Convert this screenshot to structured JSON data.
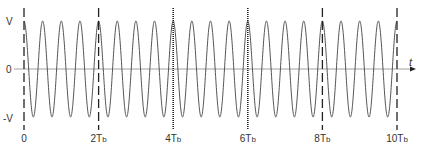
{
  "diagram": {
    "type": "waveform",
    "cycles_per_Tb": 2,
    "total_Tb": 10,
    "y_labels": {
      "top": "V",
      "zero": "0",
      "bottom": "-V"
    },
    "x_axis_label": "t",
    "markers": [
      {
        "label": "0",
        "t_Tb": 0,
        "style": "dashed"
      },
      {
        "label": "2T",
        "sub": "b",
        "t_Tb": 2,
        "style": "dashed"
      },
      {
        "label": "4T",
        "sub": "b",
        "t_Tb": 4,
        "style": "dotted"
      },
      {
        "label": "6T",
        "sub": "b",
        "t_Tb": 6,
        "style": "dotted"
      },
      {
        "label": "8T",
        "sub": "b",
        "t_Tb": 8,
        "style": "dashed"
      },
      {
        "label": "10T",
        "sub": "b",
        "t_Tb": 10,
        "style": "dashed"
      }
    ],
    "colors": {
      "wave": "#555555",
      "axis": "#888888",
      "marker": "#222222",
      "text": "#333333"
    }
  }
}
